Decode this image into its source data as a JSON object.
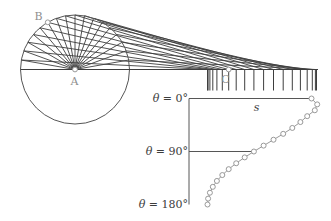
{
  "colors": {
    "dark_line": "#3e3e3e",
    "circle_line": "#555555",
    "plot_axis": "#565656",
    "curve_gray": "#999999",
    "marker_fill": "#ffffff",
    "label_gray": "#8f8f8f",
    "label_dark": "#3d3d3d",
    "background": "#ffffff"
  },
  "mechanism": {
    "center": [
      75,
      69.5
    ],
    "radius": 54.5,
    "axis_y": 69.5,
    "axis_x1": 20.5,
    "axis_x2": 318,
    "ray_step_deg": 10,
    "tick_bottom_y": 90.5,
    "point_B_angle_deg": 120,
    "labels": {
      "A": "A",
      "B": "B",
      "C": "C"
    }
  },
  "chart_data": {
    "type": "scatter",
    "xlabel": "s",
    "ylabels": [
      {
        "sym": "θ",
        "rest": " = 0°"
      },
      {
        "sym": "θ",
        "rest": " = 90°"
      },
      {
        "sym": "θ",
        "rest": " = 180°"
      }
    ],
    "theta_deg": [
      0,
      10,
      20,
      30,
      40,
      50,
      60,
      70,
      80,
      90,
      100,
      110,
      120,
      130,
      140,
      150,
      160,
      170,
      180
    ],
    "s_px": [
      311.5,
      317.2,
      314.8,
      307.2,
      300.4,
      292.3,
      283.2,
      273.5,
      263.6,
      253.9,
      244.7,
      236.2,
      228.7,
      222.3,
      216.9,
      212.8,
      209.9,
      208.1,
      207.5
    ],
    "ticks_px": [
      316.5,
      315.4,
      312.3,
      307.2,
      300.4,
      292.3,
      283.2,
      273.5,
      263.6,
      253.9,
      244.7,
      236.2,
      228.7,
      222.3,
      216.9,
      212.8,
      209.9,
      208.1,
      207.5
    ],
    "plot": {
      "left": 189,
      "top": 98.5,
      "bottom": 204.5,
      "mid_theta_index": 9,
      "s_label_x": 256.5,
      "s_label_y": 101
    }
  }
}
